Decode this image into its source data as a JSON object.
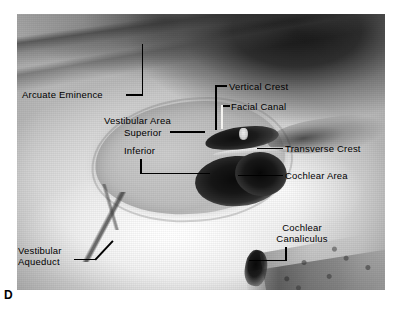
{
  "figure": {
    "panel_letter": "D",
    "modality": "anatomical-photograph"
  },
  "labels": {
    "arcuate_eminence": "Arcuate Eminence",
    "vertical_crest": "Vertical Crest",
    "facial_canal": "Facial Canal",
    "vestibular_area": "Vestibular Area",
    "superior": "Superior",
    "inferior": "Inferior",
    "transverse_crest": "Transverse Crest",
    "cochlear_area": "Cochlear Area",
    "cochlear_canaliculus_line1": "Cochlear",
    "cochlear_canaliculus_line2": "Canaliculus",
    "vestibular_aqueduct_line1": "Vestibular",
    "vestibular_aqueduct_line2": "Aqueduct"
  },
  "colors": {
    "label_text": "#000000",
    "leader_line": "#000000",
    "leader_line_light": "#f4f3f0",
    "page_background": "#ffffff"
  }
}
